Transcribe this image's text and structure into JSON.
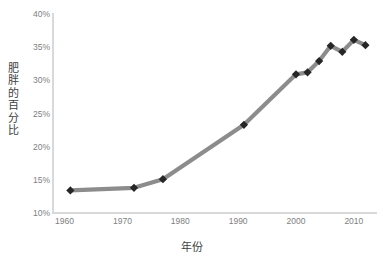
{
  "chart_data": {
    "type": "line",
    "title": "",
    "xlabel": "年份",
    "ylabel": "肥胖的百分比",
    "xlim": [
      1958,
      2014
    ],
    "ylim": [
      10,
      40
    ],
    "grid": false,
    "legend": "none",
    "series": [
      {
        "name": "肥胖的百分比",
        "line_color": "#8c8c8c",
        "marker_color": "#262626",
        "marker_shape": "diamond",
        "points": [
          {
            "x": 1961,
            "y": 13.4
          },
          {
            "x": 1972,
            "y": 13.8
          },
          {
            "x": 1977,
            "y": 15.1
          },
          {
            "x": 1991,
            "y": 23.3
          },
          {
            "x": 2000,
            "y": 30.9
          },
          {
            "x": 2002,
            "y": 31.2
          },
          {
            "x": 2004,
            "y": 32.9
          },
          {
            "x": 2006,
            "y": 35.2
          },
          {
            "x": 2008,
            "y": 34.3
          },
          {
            "x": 2010,
            "y": 36.1
          },
          {
            "x": 2012,
            "y": 35.3
          }
        ]
      }
    ],
    "y_ticks": [
      {
        "value": 40,
        "label": "40%"
      },
      {
        "value": 35,
        "label": "35%"
      },
      {
        "value": 30,
        "label": "30%"
      },
      {
        "value": 25,
        "label": "25%"
      },
      {
        "value": 20,
        "label": "20%"
      },
      {
        "value": 15,
        "label": "15%"
      },
      {
        "value": 10,
        "label": "10%"
      }
    ],
    "x_ticks": [
      {
        "value": 1960,
        "label": "1960"
      },
      {
        "value": 1970,
        "label": "1970"
      },
      {
        "value": 1980,
        "label": "1980"
      },
      {
        "value": 1990,
        "label": "1990"
      },
      {
        "value": 2000,
        "label": "2000"
      },
      {
        "value": 2010,
        "label": "2010"
      }
    ]
  },
  "axis_titles": {
    "y_chars": [
      "肥",
      "胖",
      "的",
      "百",
      "分",
      "比"
    ],
    "x_label": "年份"
  },
  "colors": {
    "line": "#8c8c8c",
    "marker": "#262626",
    "axis": "#d9d9d9",
    "tick_text": "#808080",
    "title_text": "#3f3f3f",
    "background": "#ffffff"
  }
}
